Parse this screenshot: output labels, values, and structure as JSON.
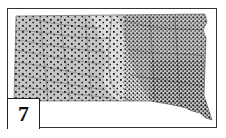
{
  "figure": {
    "label": "7",
    "colors": {
      "land": "#bdbdbd",
      "land_light": "#d6d6d6",
      "rivers": "#6a6a6a",
      "points": "#1a1a1a",
      "frame": "#333333"
    }
  }
}
